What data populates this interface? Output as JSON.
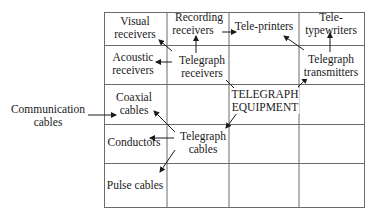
{
  "diagram": {
    "root": {
      "id": "root",
      "label_line1": "TELEGRAPH",
      "label_line2": "EQUIPMENT"
    },
    "nodes": [
      {
        "id": "visual",
        "line1": "Visual",
        "line2": "receivers"
      },
      {
        "id": "recording",
        "line1": "Recording",
        "line2": "receivers"
      },
      {
        "id": "teleprinters",
        "line1": "Tele-printers",
        "line2": ""
      },
      {
        "id": "teletypewriters",
        "line1": "Tele-",
        "line2": "typewriters"
      },
      {
        "id": "acoustic",
        "line1": "Acoustic",
        "line2": "receivers"
      },
      {
        "id": "tg_receivers",
        "line1": "Telegraph",
        "line2": "receivers"
      },
      {
        "id": "tg_transmitters",
        "line1": "Telegraph",
        "line2": "transmitters"
      },
      {
        "id": "coaxial",
        "line1": "Coaxial",
        "line2": "cables"
      },
      {
        "id": "conductors",
        "line1": "Conductors",
        "line2": ""
      },
      {
        "id": "tg_cables",
        "line1": "Telegraph",
        "line2": "cables"
      },
      {
        "id": "pulse",
        "line1": "Pulse cables",
        "line2": ""
      },
      {
        "id": "comm_cables",
        "line1": "Communication",
        "line2": "cables"
      }
    ],
    "edges": [
      {
        "from": "root",
        "to": "tg_receivers"
      },
      {
        "from": "root",
        "to": "tg_transmitters"
      },
      {
        "from": "root",
        "to": "tg_cables"
      },
      {
        "from": "tg_receivers",
        "to": "visual"
      },
      {
        "from": "tg_receivers",
        "to": "recording"
      },
      {
        "from": "tg_receivers",
        "to": "acoustic"
      },
      {
        "from": "recording",
        "to": "teleprinters"
      },
      {
        "from": "tg_transmitters",
        "to": "teleprinters"
      },
      {
        "from": "tg_transmitters",
        "to": "teletypewriters"
      },
      {
        "from": "tg_cables",
        "to": "coaxial"
      },
      {
        "from": "tg_cables",
        "to": "conductors"
      },
      {
        "from": "tg_cables",
        "to": "pulse"
      },
      {
        "from": "comm_cables",
        "to": "coaxial"
      }
    ],
    "colors": {
      "line": "#6b6b6b",
      "text": "#1a1a1a",
      "arrow": "#1a1a1a"
    }
  }
}
